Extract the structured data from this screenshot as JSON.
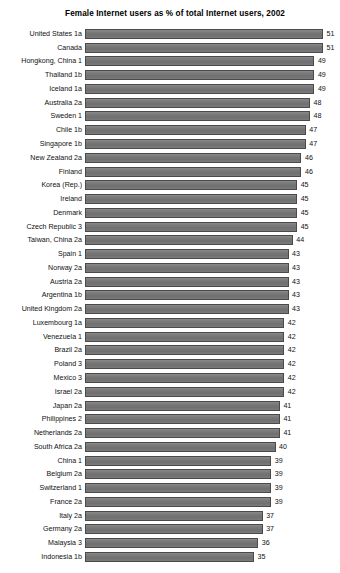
{
  "chart_data": {
    "type": "bar",
    "title": "Female Internet users as % of total Internet users, 2002",
    "xlabel": "",
    "ylabel": "",
    "orientation": "horizontal",
    "grid": false,
    "legend": null,
    "axis_baseline_value": 34,
    "value_suffix": "",
    "bar_color": "#757575",
    "bar_outline_color": "#4a4a4a",
    "categories": [
      "United States 1a",
      "Canada",
      "Hongkong, China 1",
      "Thailand 1b",
      "Iceland 1a",
      "Australia 2a",
      "Sweden 1",
      "Chile 1b",
      "Singapore 1b",
      "New Zealand 2a",
      "Finland",
      "Korea (Rep.)",
      "Ireland",
      "Denmark",
      "Czech Republic 3",
      "Taiwan, China 2a",
      "Spain 1",
      "Norway 2a",
      "Austria 2a",
      "Argentina 1b",
      "United Kingdom 2a",
      "Luxembourg 1a",
      "Venezuela 1",
      "Brazil 2a",
      "Poland 3",
      "Mexico 3",
      "Israel 2a",
      "Japan 2a",
      "Philippines 2",
      "Netherlands 2a",
      "South Africa 2a",
      "China 1",
      "Belgium 2a",
      "Switzerland 1",
      "France 2a",
      "Italy 2a",
      "Germany 2a",
      "Malaysia 3",
      "Indonesia 1b"
    ],
    "values": [
      51,
      51,
      49,
      49,
      49,
      48,
      48,
      47,
      47,
      46,
      46,
      45,
      45,
      45,
      45,
      44,
      43,
      43,
      43,
      43,
      43,
      42,
      42,
      42,
      42,
      42,
      42,
      41,
      41,
      41,
      40,
      39,
      39,
      39,
      39,
      37,
      37,
      36,
      35
    ]
  }
}
